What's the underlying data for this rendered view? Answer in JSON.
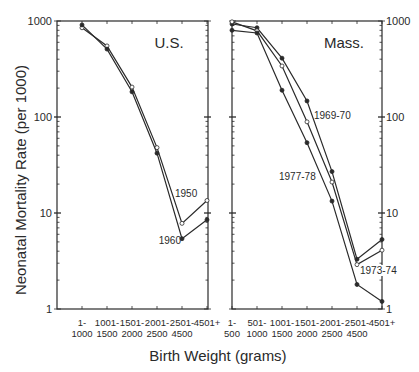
{
  "figure": {
    "ylabel": "Neonatal  Mortality  Rate  (per 1000)",
    "xlabel": "Birth  Weight  (grams)"
  },
  "chart_data": [
    {
      "type": "line",
      "title": "U.S.",
      "xlabel": "Birth Weight (grams)",
      "ylabel": "Neonatal Mortality Rate (per 1000)",
      "yscale": "log",
      "ylim": [
        1,
        1000
      ],
      "yticks": [
        "1",
        "10",
        "100",
        "1000"
      ],
      "grid": false,
      "legend": "inline labels",
      "categories": [
        "1-1000",
        "1001-1500",
        "1501-2000",
        "2001-2500",
        "2501-4500",
        "4501+"
      ],
      "category_lines": [
        [
          "1-",
          "1000"
        ],
        [
          "1001-",
          "1500"
        ],
        [
          "1501-",
          "2000"
        ],
        [
          "2001-",
          "2500"
        ],
        [
          "2501-",
          "4500"
        ],
        [
          "4501+",
          ""
        ]
      ],
      "series": [
        {
          "name": "1950",
          "marker": "open",
          "values": [
            850,
            550,
            205,
            48,
            7.8,
            13.5
          ]
        },
        {
          "name": "1960",
          "marker": "filled",
          "values": [
            910,
            510,
            183,
            42,
            5.4,
            8.5
          ]
        }
      ]
    },
    {
      "type": "line",
      "title": "Mass.",
      "xlabel": "Birth Weight (grams)",
      "ylabel": "Neonatal Mortality Rate (per 1000)",
      "yscale": "log",
      "ylim": [
        1,
        1000
      ],
      "yticks": [
        "1",
        "10",
        "100",
        "1000"
      ],
      "grid": false,
      "legend": "inline labels",
      "categories": [
        "1-500",
        "501-1000",
        "1001-1500",
        "1501-2000",
        "2001-2500",
        "2501-4500",
        "4501+"
      ],
      "category_lines": [
        [
          "1-",
          "500"
        ],
        [
          "501-",
          "1000"
        ],
        [
          "1001-",
          "1500"
        ],
        [
          "1501-",
          "2000"
        ],
        [
          "2001-",
          "2500"
        ],
        [
          "2501-",
          "4500"
        ],
        [
          "4501+",
          ""
        ]
      ],
      "series": [
        {
          "name": "1969-70",
          "marker": "filled",
          "values": [
            930,
            850,
            410,
            147,
            27,
            3.3,
            5.3
          ]
        },
        {
          "name": "1973-74",
          "marker": "open",
          "values": [
            980,
            790,
            340,
            89,
            21,
            2.9,
            4.1
          ]
        },
        {
          "name": "1977-78",
          "marker": "filled",
          "values": [
            800,
            750,
            190,
            54,
            13.3,
            1.8,
            1.2
          ]
        }
      ]
    }
  ],
  "labels": {
    "us_title": "U.S.",
    "mass_title": "Mass.",
    "s1950": "1950",
    "s1960": "1960",
    "s1969": "1969-70",
    "s1973": "1973-74",
    "s1977": "1977-78"
  }
}
